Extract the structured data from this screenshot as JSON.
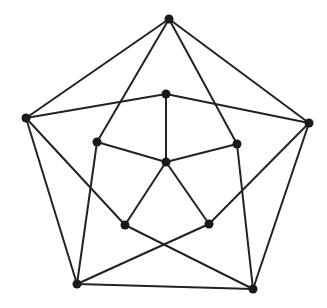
{
  "diagram": {
    "type": "graph",
    "edge_color": "#222222",
    "node_color": "#1a1a1a",
    "nodes": [
      {
        "id": "A",
        "x": 169,
        "y": 19
      },
      {
        "id": "B",
        "x": 26,
        "y": 118
      },
      {
        "id": "C",
        "x": 309,
        "y": 123
      },
      {
        "id": "D",
        "x": 77,
        "y": 284
      },
      {
        "id": "E",
        "x": 253,
        "y": 289
      },
      {
        "id": "F",
        "x": 166,
        "y": 94
      },
      {
        "id": "G",
        "x": 97,
        "y": 142
      },
      {
        "id": "H",
        "x": 237,
        "y": 144
      },
      {
        "id": "I",
        "x": 166,
        "y": 162
      },
      {
        "id": "J",
        "x": 125,
        "y": 225
      },
      {
        "id": "K",
        "x": 209,
        "y": 224
      }
    ],
    "edges": [
      [
        "A",
        "B"
      ],
      [
        "A",
        "C"
      ],
      [
        "A",
        "G"
      ],
      [
        "A",
        "H"
      ],
      [
        "B",
        "F"
      ],
      [
        "F",
        "C"
      ],
      [
        "F",
        "I"
      ],
      [
        "B",
        "D"
      ],
      [
        "B",
        "J"
      ],
      [
        "C",
        "E"
      ],
      [
        "C",
        "K"
      ],
      [
        "G",
        "I"
      ],
      [
        "H",
        "I"
      ],
      [
        "G",
        "D"
      ],
      [
        "H",
        "E"
      ],
      [
        "I",
        "J"
      ],
      [
        "I",
        "K"
      ],
      [
        "J",
        "E"
      ],
      [
        "K",
        "D"
      ],
      [
        "D",
        "E"
      ]
    ]
  }
}
